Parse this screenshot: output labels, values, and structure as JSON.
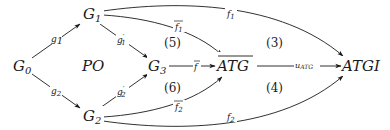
{
  "diagram": {
    "nodes": {
      "g0": {
        "base": "G",
        "sub": "0"
      },
      "g1": {
        "base": "G",
        "sub": "1"
      },
      "g2": {
        "base": "G",
        "sub": "2"
      },
      "g3": {
        "base": "G",
        "sub": "3"
      },
      "atg_bar": {
        "label": "ATG",
        "overline": true
      },
      "atgi": {
        "label": "ATGI"
      },
      "po": {
        "label": "PO"
      }
    },
    "edges": {
      "g1": {
        "base": "g",
        "sub": "1",
        "from": "G0",
        "to": "G1"
      },
      "g2": {
        "base": "g",
        "sub": "2",
        "from": "G0",
        "to": "G2"
      },
      "g1_prime": {
        "base": "g",
        "sup": "′",
        "sub": "1",
        "from": "G1",
        "to": "G3"
      },
      "g2_prime": {
        "base": "g",
        "sup": "′",
        "sub": "2",
        "from": "G2",
        "to": "G3"
      },
      "f_bar": {
        "base": "f",
        "overline": true,
        "from": "G3",
        "to": "ATG-bar"
      },
      "f1_bar": {
        "base": "f",
        "sub": "1",
        "overline": true,
        "from": "G1",
        "to": "ATG-bar"
      },
      "f2_bar": {
        "base": "f",
        "sub": "2",
        "overline": true,
        "from": "G2",
        "to": "ATG-bar"
      },
      "f1": {
        "base": "f",
        "sub": "1",
        "from": "G1",
        "to": "ATGI"
      },
      "f2": {
        "base": "f",
        "sub": "2",
        "from": "G2",
        "to": "ATGI"
      },
      "u_atg": {
        "base": "u",
        "sub": "ATG",
        "from": "ATG-bar",
        "to": "ATGI"
      }
    },
    "regions": {
      "r3": "(3)",
      "r4": "(4)",
      "r5": "(5)",
      "r6": "(6)"
    }
  }
}
